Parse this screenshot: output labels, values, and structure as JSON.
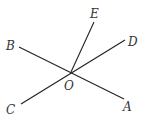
{
  "diagram": {
    "type": "intersecting-lines",
    "center": {
      "label": "O",
      "x": 71,
      "y": 72,
      "label_x": 64,
      "label_y": 90
    },
    "lines": [
      {
        "name": "line-BA",
        "from": {
          "label": "B",
          "x": 19,
          "y": 47
        },
        "to": {
          "label": "A",
          "x": 124,
          "y": 99
        }
      },
      {
        "name": "line-CD",
        "from": {
          "label": "C",
          "x": 21,
          "y": 104
        },
        "to": {
          "label": "D",
          "x": 125,
          "y": 40
        }
      }
    ],
    "rays": [
      {
        "name": "ray-OE",
        "from": "O",
        "to": {
          "label": "E",
          "x": 94,
          "y": 22
        }
      }
    ],
    "labels": {
      "A": {
        "text": "A",
        "x": 123,
        "y": 111
      },
      "B": {
        "text": "B",
        "x": 6,
        "y": 50
      },
      "C": {
        "text": "C",
        "x": 6,
        "y": 114
      },
      "D": {
        "text": "D",
        "x": 128,
        "y": 46
      },
      "E": {
        "text": "E",
        "x": 90,
        "y": 18
      },
      "O": {
        "text": "O",
        "x": 64,
        "y": 90
      }
    },
    "stroke_color": "#222222"
  }
}
